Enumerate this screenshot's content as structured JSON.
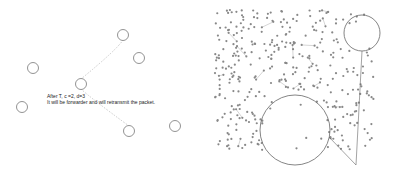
{
  "left_panel": {
    "annotation_line1": "After T, c =2, d=3",
    "annotation_line2": "It will be forwarder and will retransmit the packet.",
    "nodes": [
      {
        "x": 123,
        "y": 35
      },
      {
        "x": 139,
        "y": 58
      },
      {
        "x": 33,
        "y": 68
      },
      {
        "x": 81,
        "y": 84
      },
      {
        "x": 22,
        "y": 107
      },
      {
        "x": 129,
        "y": 131
      },
      {
        "x": 175,
        "y": 126
      }
    ],
    "paths": [
      {
        "from": 0,
        "to": 3
      },
      {
        "from": 3,
        "to": 5
      }
    ],
    "colors": {
      "node_stroke": "#777777",
      "path": "#bbbbbb"
    }
  },
  "right_panel": {
    "region": {
      "x": 215,
      "y": 10,
      "w": 160,
      "h": 140
    },
    "highlight_circles": [
      {
        "cx": 295,
        "cy": 130,
        "r": 35
      },
      {
        "cx": 362,
        "cy": 33,
        "r": 18
      }
    ],
    "convergence_point": {
      "x": 356,
      "y": 165
    },
    "colors": {
      "node": "#888888",
      "edge": "#aaaaaa",
      "circle": "#666666"
    }
  }
}
